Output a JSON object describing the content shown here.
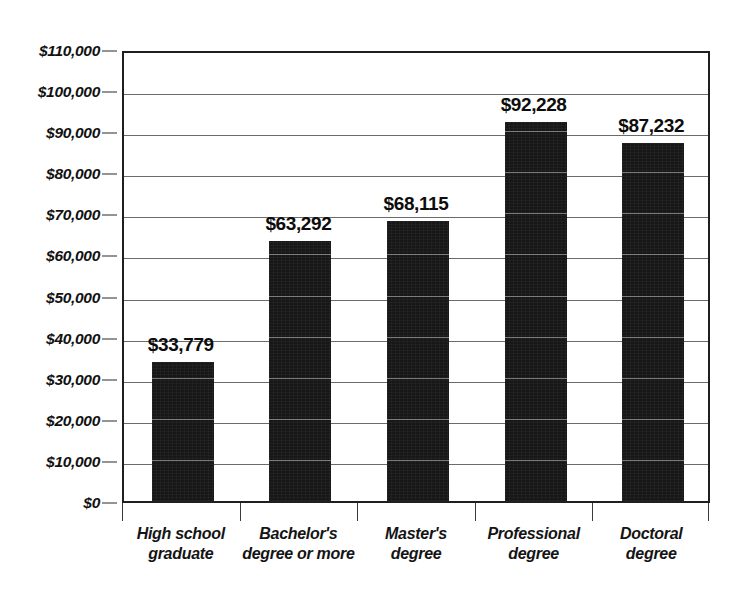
{
  "chart_data": {
    "type": "bar",
    "title": "",
    "subtitle": "",
    "xlabel": "",
    "ylabel": "",
    "ylim": [
      0,
      110000
    ],
    "ytick_step": 10000,
    "grid": true,
    "legend": "none",
    "orientation": "vertical",
    "bar_color": "#171717",
    "categories": [
      "High school graduate",
      "Bachelor's degree or more",
      "Master's degree",
      "Professional degree",
      "Doctoral degree"
    ],
    "category_lines": [
      [
        "High school",
        "graduate"
      ],
      [
        "Bachelor's",
        "degree or more"
      ],
      [
        "Master's",
        "degree"
      ],
      [
        "Professional",
        "degree"
      ],
      [
        "Doctoral",
        "degree"
      ]
    ],
    "values": [
      33779,
      63292,
      68115,
      92228,
      87232
    ],
    "value_labels": [
      "$33,779",
      "$63,292",
      "$68,115",
      "$92,228",
      "$87,232"
    ],
    "ytick_labels": [
      "$110,000",
      "$100,000",
      "$90,000",
      "$80,000",
      "$70,000",
      "$60,000",
      "$50,000",
      "$40,000",
      "$30,000",
      "$20,000",
      "$10,000",
      "$0"
    ],
    "ytick_values": [
      110000,
      100000,
      90000,
      80000,
      70000,
      60000,
      50000,
      40000,
      30000,
      20000,
      10000,
      0
    ]
  }
}
